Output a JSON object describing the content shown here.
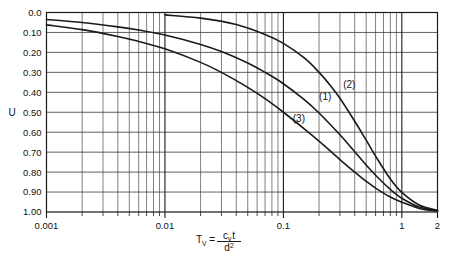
{
  "chart_data": {
    "type": "line",
    "title": "",
    "subtitle": "",
    "xlabel": "T_V = c_v t / d^2",
    "xlabel_parts": {
      "base": "T",
      "base_sub": "V",
      "equals": "=",
      "numerator": "c",
      "numerator_sub": "v",
      "numerator_tail": "t",
      "denominator": "d",
      "denominator_sup": "2"
    },
    "ylabel": "U",
    "xscale": "log",
    "yscale": "linear",
    "xlim": [
      0.001,
      2
    ],
    "ylim": [
      0,
      1
    ],
    "y_inverted": true,
    "grid": true,
    "grid_minor": true,
    "legend_position": "inline-annotations",
    "xticks": [
      0.001,
      0.01,
      0.1,
      1,
      2
    ],
    "xtick_labels": [
      "0.001",
      "0.01",
      "0.1",
      "1",
      "2"
    ],
    "yticks": [
      0.0,
      0.1,
      0.2,
      0.3,
      0.4,
      0.5,
      0.6,
      0.7,
      0.8,
      0.9,
      1.0
    ],
    "ytick_labels": [
      "0.0",
      "0.10",
      "0.20",
      "0.30",
      "0.40",
      "0.50",
      "0.60",
      "0.70",
      "0.80",
      "0.90",
      "1.00"
    ],
    "annotations": [
      {
        "text": "(1)",
        "x": 0.2,
        "y": 0.44
      },
      {
        "text": "(2)",
        "x": 0.32,
        "y": 0.38
      },
      {
        "text": "(3)",
        "x": 0.12,
        "y": 0.55
      }
    ],
    "series": [
      {
        "name": "(1)",
        "label": "(1)",
        "color": "#1a1a1a",
        "x": [
          0.001,
          0.002,
          0.004,
          0.006,
          0.01,
          0.02,
          0.03,
          0.05,
          0.07,
          0.1,
          0.15,
          0.2,
          0.3,
          0.4,
          0.5,
          0.6,
          0.8,
          1.0,
          1.4,
          2.0
        ],
        "y": [
          0.035,
          0.05,
          0.072,
          0.088,
          0.113,
          0.16,
          0.196,
          0.253,
          0.3,
          0.357,
          0.437,
          0.504,
          0.613,
          0.698,
          0.764,
          0.816,
          0.887,
          0.931,
          0.975,
          0.994
        ]
      },
      {
        "name": "(2)",
        "label": "(2)",
        "color": "#1a1a1a",
        "x": [
          0.01,
          0.02,
          0.04,
          0.07,
          0.1,
          0.15,
          0.2,
          0.25,
          0.3,
          0.4,
          0.5,
          0.6,
          0.8,
          1.0,
          1.4,
          2.0
        ],
        "y": [
          0.012,
          0.028,
          0.06,
          0.11,
          0.155,
          0.228,
          0.3,
          0.367,
          0.43,
          0.545,
          0.64,
          0.72,
          0.835,
          0.902,
          0.965,
          0.992
        ]
      },
      {
        "name": "(3)",
        "label": "(3)",
        "color": "#1a1a1a",
        "x": [
          0.001,
          0.002,
          0.004,
          0.006,
          0.01,
          0.02,
          0.03,
          0.05,
          0.07,
          0.1,
          0.15,
          0.2,
          0.3,
          0.4,
          0.5,
          0.6,
          0.8,
          1.0,
          1.4,
          2.0
        ],
        "y": [
          0.062,
          0.086,
          0.12,
          0.145,
          0.182,
          0.25,
          0.3,
          0.375,
          0.432,
          0.5,
          0.583,
          0.645,
          0.737,
          0.8,
          0.846,
          0.88,
          0.925,
          0.951,
          0.982,
          0.996
        ]
      }
    ]
  }
}
